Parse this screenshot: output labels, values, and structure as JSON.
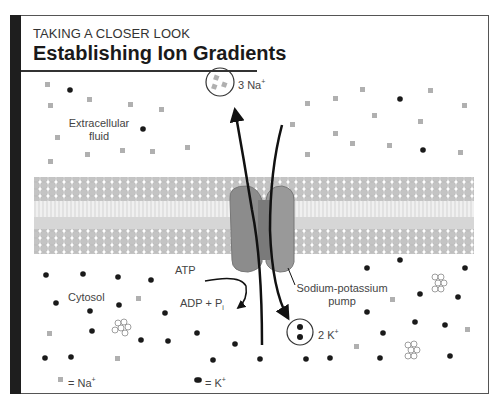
{
  "header": {
    "kicker": "TAKING A CLOSER LOOK",
    "title": "Establishing Ion Gradients"
  },
  "regions": {
    "extracellular_line1": "Extracellular",
    "extracellular_line2": "fluid",
    "cytosol": "Cytosol"
  },
  "pump": {
    "label_line1": "Sodium-potassium",
    "label_line2": "pump",
    "na_out_count": "3 Na",
    "na_charge": "+",
    "k_in_count": "2 K",
    "k_charge": "+",
    "atp": "ATP",
    "adp": "ADP + P",
    "adp_sub": "i"
  },
  "legend": {
    "na_label": "= Na",
    "na_charge": "+",
    "k_label": "= K",
    "k_charge": "+"
  },
  "colors": {
    "frame_bar": "#1e1e1e",
    "membrane_heads": "#c4c4c4",
    "membrane_tails": "#d9d9d9",
    "pump_protein": "#8c8c8c",
    "na_ion": "#b0b0b0",
    "k_ion": "#1a1a1a"
  }
}
